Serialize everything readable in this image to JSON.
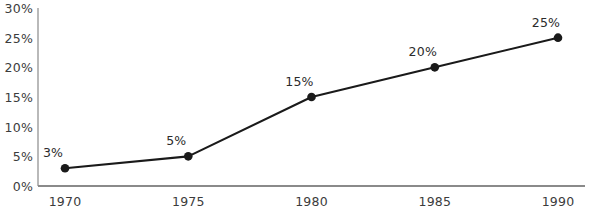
{
  "chart_data": {
    "type": "line",
    "title": "",
    "subtitle": "",
    "xlabel": "",
    "ylabel": "",
    "x": [
      1970,
      1975,
      1980,
      1985,
      1990
    ],
    "categories": [
      "1970",
      "1975",
      "1980",
      "1985",
      "1990"
    ],
    "values": [
      3,
      5,
      15,
      20,
      25
    ],
    "point_labels": [
      "3%",
      "5%",
      "15%",
      "20%",
      "25%"
    ],
    "xtick_labels": [
      "1970",
      "1975",
      "1980",
      "1985",
      "1990"
    ],
    "ytick_labels": [
      "0%",
      "5%",
      "10%",
      "15%",
      "20%",
      "25%",
      "30%"
    ],
    "ytick_values": [
      0,
      5,
      10,
      15,
      20,
      25,
      30
    ],
    "ylim": [
      0,
      30
    ],
    "xlim": [
      1970,
      1990
    ],
    "grid": false,
    "legend": false,
    "legend_position": "none",
    "line_color": "#1a1a1a",
    "marker_color": "#1a1a1a",
    "axis_color": "#8a8a8a",
    "text_color": "#3c3c3c",
    "background_color": "#ffffff"
  },
  "axes": {
    "plot_left": 38,
    "plot_right": 585,
    "plot_top": 8,
    "plot_bottom": 186,
    "y_label_right": 33,
    "x_label_top": 194
  }
}
